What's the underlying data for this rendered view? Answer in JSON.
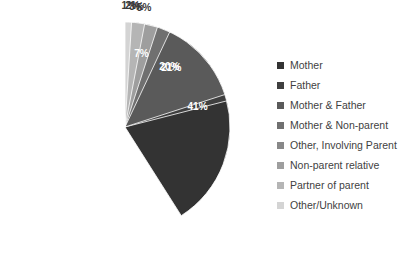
{
  "chart_data": {
    "type": "pie",
    "title": "",
    "subtitle": "",
    "xlabel": "",
    "ylabel": "",
    "grid": false,
    "legend_position": "right",
    "start_angle_deg": 0,
    "direction": "clockwise",
    "units": "percent",
    "total": 100,
    "categories": [
      "Mother",
      "Father",
      "Mother & Father",
      "Mother & Non-parent",
      "Other, Involving Parent",
      "Non-parent relative",
      "Partner of parent",
      "Other/Unknown"
    ],
    "values": [
      41,
      21,
      20,
      7,
      2,
      5,
      3,
      1
    ],
    "data_labels": [
      "41%",
      "21%",
      "20%",
      "7%",
      "2%",
      "5%",
      "3%",
      "1%"
    ],
    "colors": [
      "#333333",
      "#3f3f3f",
      "#5a5a5a",
      "#707070",
      "#888888",
      "#9e9e9e",
      "#b5b5b5",
      "#d4d4d4"
    ],
    "label_placement": [
      "inside",
      "inside",
      "inside",
      "inside",
      "outside",
      "outside",
      "outside",
      "outside"
    ]
  },
  "geometry": {
    "center_x": 125,
    "center_y": 127,
    "radius": 105,
    "label_radius_inside": 0.72,
    "label_radius_outside": 1.16
  },
  "legend": {
    "entries": [
      {
        "label": "Mother",
        "color": "#333333"
      },
      {
        "label": "Father",
        "color": "#3f3f3f"
      },
      {
        "label": "Mother & Father",
        "color": "#5a5a5a"
      },
      {
        "label": "Mother & Non-parent",
        "color": "#707070"
      },
      {
        "label": "Other, Involving Parent",
        "color": "#888888"
      },
      {
        "label": "Non-parent relative",
        "color": "#9e9e9e"
      },
      {
        "label": "Partner of parent",
        "color": "#b5b5b5"
      },
      {
        "label": "Other/Unknown",
        "color": "#d4d4d4"
      }
    ]
  }
}
